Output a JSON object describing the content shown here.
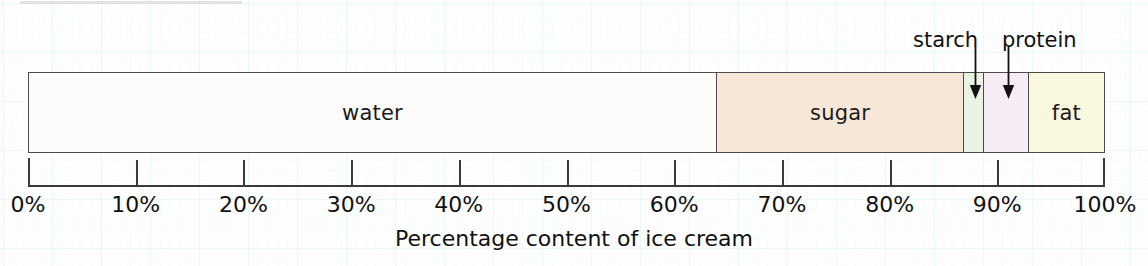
{
  "chart_data": {
    "type": "bar",
    "orientation": "horizontal-stacked",
    "title": "",
    "xlabel": "Percentage content of ice cream",
    "ylabel": "",
    "xlim": [
      0,
      100
    ],
    "grid": false,
    "legend": "none",
    "categories": [
      "water",
      "sugar",
      "starch",
      "protein",
      "fat"
    ],
    "values": [
      64,
      23,
      1.8,
      4.2,
      7
    ],
    "segments": [
      {
        "name": "water",
        "label": "water",
        "start": 0,
        "end": 64,
        "value": 64,
        "color": "#fdfcfa",
        "label_inside": true
      },
      {
        "name": "sugar",
        "label": "sugar",
        "start": 64,
        "end": 87,
        "value": 23,
        "color": "#f7e7d9",
        "label_inside": true
      },
      {
        "name": "starch",
        "label": "starch",
        "start": 87,
        "end": 88.8,
        "value": 1.8,
        "color": "#e9f2e3",
        "label_inside": false
      },
      {
        "name": "protein",
        "label": "protein",
        "start": 88.8,
        "end": 93,
        "value": 4.2,
        "color": "#f6ecf4",
        "label_inside": false
      },
      {
        "name": "fat",
        "label": "fat",
        "start": 93,
        "end": 100,
        "value": 7,
        "color": "#f9f7dd",
        "label_inside": true
      }
    ],
    "callouts": [
      {
        "name": "starch",
        "label": "starch",
        "points_to": 87.9
      },
      {
        "name": "protein",
        "label": "protein",
        "points_to": 90.9
      }
    ],
    "ticks": [
      0,
      10,
      20,
      30,
      40,
      50,
      60,
      70,
      80,
      90,
      100
    ],
    "tick_labels": [
      "0%",
      "10%",
      "20%",
      "30%",
      "40%",
      "50%",
      "60%",
      "70%",
      "80%",
      "90%",
      "100%"
    ],
    "colors": {
      "outline": "#4a4a4a",
      "axis": "#3a3a3a",
      "text": "#111111",
      "background": "#fdfdfd",
      "grid": "#b0e0ec"
    }
  }
}
